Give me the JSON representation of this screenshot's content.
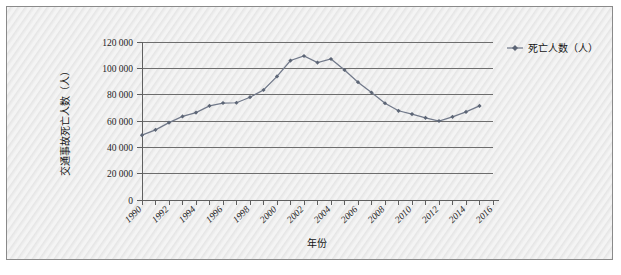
{
  "figure": {
    "background_color": "#ebebeb",
    "border_color": "#8a8a8a"
  },
  "legend": {
    "position": "top-right",
    "entries": [
      {
        "label": "死亡人数（人）",
        "marker": "line-marker-icon",
        "color": "#71798a"
      }
    ]
  },
  "axes": {
    "y_title": "交通事故死亡人数（人）",
    "x_title": "年份",
    "y_ticks": [
      "0",
      "20 000",
      "40 000",
      "60 000",
      "80 000",
      "100 000",
      "120 000"
    ],
    "x_ticks": [
      "1990",
      "1992",
      "1994",
      "1996",
      "1998",
      "2000",
      "2002",
      "2004",
      "2006",
      "2008",
      "2010",
      "2012",
      "2014",
      "2016"
    ]
  },
  "chart_data": {
    "type": "line",
    "title": "",
    "xlabel": "年份",
    "ylabel": "交通事故死亡人数（人）",
    "xlim": [
      1990,
      2016
    ],
    "ylim": [
      0,
      120000
    ],
    "grid": true,
    "legend_position": "top-right",
    "x": [
      1990,
      1991,
      1992,
      1993,
      1994,
      1995,
      1996,
      1997,
      1998,
      1999,
      2000,
      2001,
      2002,
      2003,
      2004,
      2005,
      2006,
      2007,
      2008,
      2009,
      2010,
      2011,
      2012,
      2013,
      2014,
      2015
    ],
    "series": [
      {
        "name": "死亡人数（人）",
        "color": "#71798a",
        "values": [
          49271,
          53292,
          58729,
          63508,
          66362,
          71494,
          73655,
          73861,
          78067,
          83529,
          93853,
          105930,
          109381,
          104372,
          107077,
          98738,
          89455,
          81649,
          73484,
          67759,
          65225,
          62387,
          59997,
          63171,
          66894,
          71485
        ]
      }
    ]
  }
}
